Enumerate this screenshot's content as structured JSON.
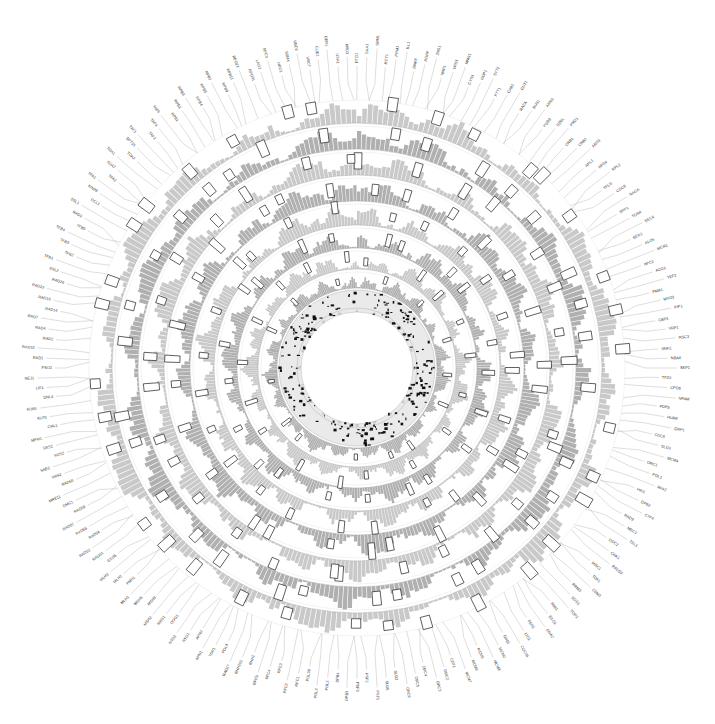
{
  "figure": {
    "type": "circos-genome-plot",
    "width": 715,
    "height": 724,
    "center_x": 357,
    "center_y": 368,
    "background": "#ffffff",
    "title": ""
  },
  "colors": {
    "background": "#ffffff",
    "bar_fill": "#a9a9a9",
    "bar_fill_light": "#c4c4c4",
    "track_line": "#9a9a9a",
    "marker_stroke": "#2b2b2b",
    "marker_fill": "#ffffff",
    "scatter_point": "#101010",
    "leader_line": "#b0b0b0",
    "label_text": "#3a3a3a",
    "tick_text": "#8e8e8e",
    "inner_band": "#d9d9d9"
  },
  "chart_data": {
    "type": "heatmap",
    "title": "",
    "subtitle": "",
    "xlabel": "",
    "ylabel": "",
    "grid": false,
    "legend_position": "none",
    "layout": {
      "geometry": "polar",
      "angle_start_deg": -90,
      "angle_sweep_deg": 360,
      "gap_deg": 1.2,
      "outer_radius": 268,
      "inner_radius": 92
    },
    "tracks": [
      {
        "name": "track-1",
        "index": 0,
        "type": "bar",
        "r_outer": 268,
        "r_inner": 245,
        "fill": "#a9a9a9",
        "n_bars": 300,
        "markers": 34
      },
      {
        "name": "track-2",
        "index": 1,
        "type": "bar",
        "r_outer": 242,
        "r_inner": 219,
        "fill": "#a9a9a9",
        "n_bars": 300,
        "markers": 31
      },
      {
        "name": "track-3",
        "index": 2,
        "type": "bar",
        "r_outer": 216,
        "r_inner": 193,
        "fill": "#a9a9a9",
        "n_bars": 300,
        "markers": 29
      },
      {
        "name": "track-4",
        "index": 3,
        "type": "bar",
        "r_outer": 190,
        "r_inner": 167,
        "fill": "#a9a9a9",
        "n_bars": 300,
        "markers": 27
      },
      {
        "name": "track-5",
        "index": 4,
        "type": "bar",
        "r_outer": 164,
        "r_inner": 143,
        "fill": "#a9a9a9",
        "n_bars": 300,
        "markers": 24
      },
      {
        "name": "track-6",
        "index": 5,
        "type": "bar",
        "r_outer": 140,
        "r_inner": 120,
        "fill": "#a9a9a9",
        "n_bars": 300,
        "markers": 21
      },
      {
        "name": "track-7",
        "index": 6,
        "type": "bar",
        "r_outer": 117,
        "r_inner": 99,
        "fill": "#a9a9a9",
        "n_bars": 300,
        "markers": 18
      },
      {
        "name": "track-8",
        "index": 7,
        "type": "bar",
        "r_outer": 96,
        "r_inner": 80,
        "fill": "#a9a9a9",
        "n_bars": 300,
        "markers": 14
      }
    ],
    "scatter_ring": {
      "name": "inner-scatter-ring",
      "r_outer": 78,
      "r_inner": 56,
      "point_color": "#101010",
      "point_count": 420,
      "band_fill": "#d9d9d9"
    },
    "tick_ring": {
      "name": "inner-tick-ring",
      "radius": 60,
      "label_color": "#8e8e8e",
      "labels": [
        "0",
        "5",
        "10",
        "15",
        "20",
        "25",
        "30",
        "35",
        "40",
        "45",
        "50",
        "55",
        "60",
        "65",
        "70",
        "75",
        "80",
        "85",
        "90",
        "95"
      ]
    }
  },
  "gene_labels": [
    "RTG1",
    "GAA1",
    "SRN1",
    "RCY1",
    "PRM1",
    "ILL1",
    "DNF8",
    "RGRP",
    "ZNS1",
    "NAP1",
    "VPS3",
    "MMS1",
    "CYS3",
    "GDP1",
    "SYT2",
    "PTT1",
    "CAB1",
    "GUT1",
    "RAZA",
    "BUS1",
    "ARN2",
    "YGR8",
    "SZRL",
    "PRD1",
    "CRB1",
    "CNB2",
    "ANS3",
    "APL1",
    "RPS4",
    "RPL2",
    "TFC3",
    "CDC9",
    "NAGA",
    "SRP1",
    "TOR4",
    "SEC4",
    "SER3",
    "ALO5",
    "MCR1",
    "APC2",
    "ACO1",
    "TEF2",
    "FNM1",
    "MYO3",
    "PIP1",
    "CBP3",
    "VRP1",
    "RSC3",
    "SNF2",
    "NBA4",
    "SKP1",
    "TFZ0",
    "CPD6",
    "NFAM",
    "PDR5",
    "HUR8",
    "QRP1",
    "CDC6",
    "SLD3",
    "MCM4",
    "ORC1",
    "POL1",
    "RFA2",
    "PRI1",
    "DPB2",
    "CTF4",
    "RAD9",
    "MEC1",
    "TEL1",
    "DDC2",
    "CHK1",
    "RAD53",
    "MRC1",
    "TOF1",
    "CSM3",
    "RRM3",
    "SGS1",
    "TOP3",
    "RMI1",
    "EXO1",
    "DNA2",
    "FEN1",
    "LIG1",
    "CDC45",
    "GINS",
    "MCM2",
    "MCM3",
    "MCM5",
    "MCM6",
    "MCM7",
    "CDT1",
    "ORC2",
    "ORC3",
    "ORC4",
    "ORC5",
    "ORC6",
    "SLD2",
    "SLD5",
    "PSF1",
    "PSF2",
    "PSF3",
    "DPB3",
    "DPB4",
    "POL2",
    "POL3",
    "POL30",
    "RFC1",
    "RFC2",
    "RFC3",
    "RFC4",
    "RFC5",
    "RNH1",
    "RNH201",
    "RAD27",
    "POL4",
    "TDP1",
    "APN1",
    "APN2",
    "NTG1",
    "NTG2",
    "OGG1",
    "MAG1",
    "MSH2",
    "MSH3",
    "MSH6",
    "MLH1",
    "PMS1",
    "MLH2",
    "MLH3",
    "EXO5",
    "RAD51",
    "RAD52",
    "RAD54",
    "RAD55",
    "RAD57",
    "RAD59",
    "DMC1",
    "MRE11",
    "RAD50",
    "XRS2",
    "SAE2",
    "SGS2",
    "SRS2",
    "MPH1",
    "CHL1",
    "KU70",
    "KU80",
    "DNL4",
    "LIF1",
    "NEJ1",
    "PSO2",
    "RAD1",
    "RAD10",
    "RAD2",
    "RAD4",
    "RAD7",
    "RAD14",
    "RAD16",
    "RAD23",
    "RAD26",
    "SSL2",
    "TFB1",
    "TFB2",
    "TFB3",
    "TFB4",
    "TFB5",
    "RAD3",
    "SSL1",
    "CCL1",
    "KIN28",
    "TFA1",
    "TFA2",
    "SUA7",
    "TOA1",
    "TOA2",
    "SPT15",
    "TAF1",
    "TAF2",
    "TAF4",
    "TAF5",
    "RPB1",
    "RPB2",
    "RPB3",
    "RPB4",
    "RPB5",
    "RPB7",
    "RPB9",
    "RPB11",
    "RPO21",
    "RPO31",
    "LAG2",
    "SPC3",
    "HRD1",
    "SSM4",
    "UBC6",
    "UBC7",
    "CUE1",
    "DER1",
    "USA1",
    "HRD3"
  ],
  "annotations": {
    "axis_visible": false,
    "outer_leader_lines": true,
    "leader_line_count": 200
  }
}
